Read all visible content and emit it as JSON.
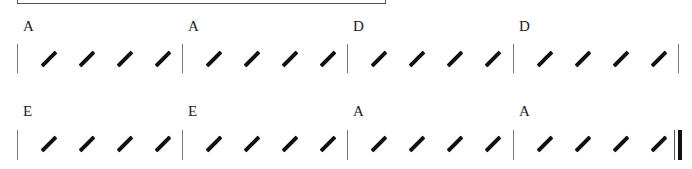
{
  "document": {
    "type": "chord-slash-chart",
    "beats_per_measure": 4,
    "rows": [
      {
        "measures": [
          {
            "chord": "A"
          },
          {
            "chord": "A"
          },
          {
            "chord": "D"
          },
          {
            "chord": "D"
          }
        ]
      },
      {
        "measures": [
          {
            "chord": "E"
          },
          {
            "chord": "E"
          },
          {
            "chord": "A"
          },
          {
            "chord": "A"
          }
        ]
      }
    ],
    "ending": "final-double-barline"
  }
}
